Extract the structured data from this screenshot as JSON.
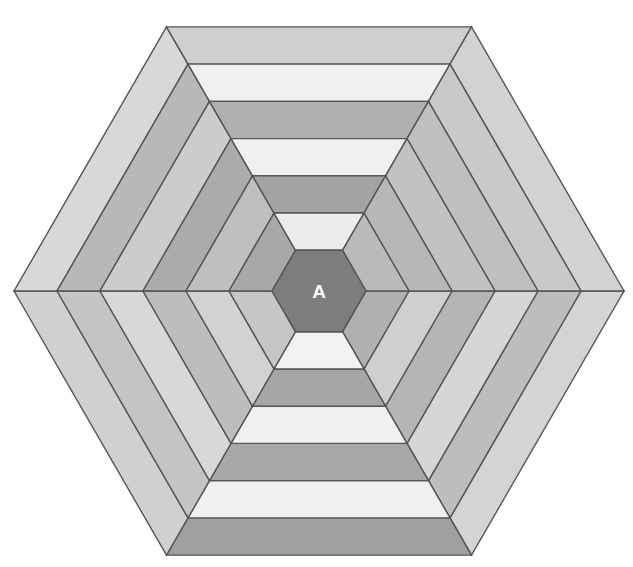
{
  "figure": {
    "type": "geometric-diagram",
    "background_color": "#ffffff",
    "center_label": "A",
    "center_label_color": "#ffffff",
    "outline_color": "#555555",
    "outline_width": 1.4
  },
  "geometry": {
    "center_x": 319,
    "center_y": 291,
    "outer_radius": 305,
    "rings": 6,
    "sides": 6,
    "ring_step": 43,
    "core_radius": 40,
    "orientation": "flat-top",
    "vertices_outer": [
      {
        "x": 624,
        "y": 291
      },
      {
        "x": 471,
        "y": 30
      },
      {
        "x": 167,
        "y": 30
      },
      {
        "x": 14,
        "y": 291
      },
      {
        "x": 167,
        "y": 553
      },
      {
        "x": 471,
        "y": 553
      }
    ]
  },
  "palette": {
    "dark": "#8c8c8c",
    "medium": "#a9a9a9",
    "light_medium": "#bcbcbc",
    "light": "#d4d4d4",
    "very_light": "#ececec",
    "near_white": "#f2f2f2",
    "core": "#7d7d7d"
  },
  "rings_data": [
    {
      "index": 0,
      "name": "ring-outer-1",
      "radius_outer": 305,
      "radius_inner": 262,
      "strip_colors": [
        "#d4d4d4",
        "#a0a0a0",
        "#d0d0d0",
        "#d8d8d8",
        "#cfcfcf",
        "#d2d2d2"
      ]
    },
    {
      "index": 1,
      "name": "ring-2",
      "radius_outer": 262,
      "radius_inner": 219,
      "strip_colors": [
        "#bdbdbd",
        "#f0f0f0",
        "#c4c4c4",
        "#b8b8b8",
        "#f0f0f0",
        "#c9c9c9"
      ]
    },
    {
      "index": 2,
      "name": "ring-3",
      "radius_outer": 219,
      "radius_inner": 176,
      "strip_colors": [
        "#d6d6d6",
        "#a8a8a8",
        "#d8d8d8",
        "#cccccc",
        "#b0b0b0",
        "#bfbfbf"
      ]
    },
    {
      "index": 3,
      "name": "ring-4",
      "radius_outer": 176,
      "radius_inner": 133,
      "strip_colors": [
        "#b5b5b5",
        "#f0f0f0",
        "#bdbdbd",
        "#ababab",
        "#f0f0f0",
        "#c2c2c2"
      ]
    },
    {
      "index": 4,
      "name": "ring-5",
      "radius_outer": 133,
      "radius_inner": 90,
      "strip_colors": [
        "#cfcfcf",
        "#a6a6a6",
        "#d2d2d2",
        "#bfbfbf",
        "#a3a3a3",
        "#b7b7b7"
      ]
    },
    {
      "index": 5,
      "name": "ring-inner-6",
      "radius_outer": 90,
      "radius_inner": 47,
      "strip_colors": [
        "#b0b0b0",
        "#f2f2f2",
        "#c6c6c6",
        "#a8a8a8",
        "#ececec",
        "#bababa"
      ]
    }
  ],
  "core": {
    "name": "center-hexagon",
    "radius": 47,
    "color": "#7d7d7d",
    "label": "A"
  }
}
